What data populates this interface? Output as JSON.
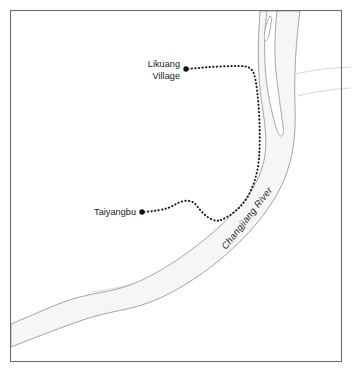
{
  "figure": {
    "background_color": "#ffffff",
    "frame_color": "#6e6e6e",
    "width": 352,
    "height": 373
  },
  "map": {
    "river": {
      "name_label": "Changjiang River",
      "water_fill_color": "#f6f6f6",
      "bank_line_color": "#9a9a9a",
      "island_fill_color": "#ffffff",
      "label_rotation_deg": 58,
      "description": "Wide river band entering from the right/top edge, bending south-west and exiting at the left edge; contains two elongated mid-channel islands in the upper reach."
    },
    "places": [
      {
        "id": "likuang-village",
        "label_line1": "Likuang",
        "label_line2": "Village",
        "marker_color": "#111111",
        "x": 186,
        "y": 69
      },
      {
        "id": "taiyangbu",
        "label_line1": "Taiyangbu",
        "label_line2": "",
        "marker_color": "#111111",
        "x": 142,
        "y": 212
      }
    ],
    "trails": [
      {
        "id": "likuang-trail",
        "from": "likuang-village",
        "to": "river-bank",
        "style": "dotted",
        "color": "#1d1d1d"
      },
      {
        "id": "taiyangbu-trail",
        "from": "taiyangbu",
        "to": "river-bank",
        "style": "dotted",
        "color": "#1d1d1d"
      }
    ]
  }
}
